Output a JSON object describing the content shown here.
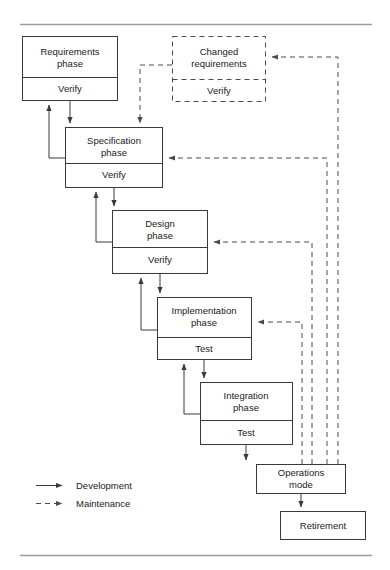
{
  "figure": {
    "top_rule": true,
    "bottom_rule": true
  },
  "boxes": {
    "requirements": {
      "title_line1": "Requirements",
      "title_line2": "phase",
      "footer": "Verify",
      "style": "solid"
    },
    "changed_requirements": {
      "title_line1": "Changed",
      "title_line2": "requirements",
      "footer": "Verify",
      "style": "dashed"
    },
    "specification": {
      "title_line1": "Specification",
      "title_line2": "phase",
      "footer": "Verify",
      "style": "solid"
    },
    "design": {
      "title_line1": "Design",
      "title_line2": "phase",
      "footer": "Verify",
      "style": "solid"
    },
    "implementation": {
      "title_line1": "Implementation",
      "title_line2": "phase",
      "footer": "Test",
      "style": "solid"
    },
    "integration": {
      "title_line1": "Integration",
      "title_line2": "phase",
      "footer": "Test",
      "style": "solid"
    },
    "operations": {
      "title_line1": "Operations",
      "title_line2": "mode",
      "footer": "",
      "style": "solid"
    },
    "retirement": {
      "title_line1": "Retirement",
      "title_line2": "",
      "footer": "",
      "style": "solid"
    }
  },
  "legend": {
    "items": [
      {
        "label": "Development",
        "line": "solid"
      },
      {
        "label": "Maintenance",
        "line": "dashed"
      }
    ]
  },
  "colors": {
    "box_stroke": "#3a3a3a",
    "dashed_stroke": "#4a4a4a",
    "text": "#1a1a1a",
    "rule": "#9a9a9a",
    "background": "#ffffff"
  }
}
